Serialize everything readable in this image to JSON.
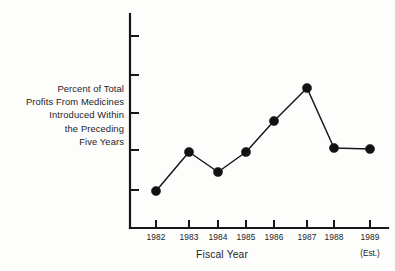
{
  "chart_data": {
    "type": "line",
    "title": "",
    "xlabel": "Fiscal Year",
    "ylabel": "Percent of Total Profits From Medicines Introduced Within the Preceding Five Years",
    "ylabel_lines": [
      "Percent of Total",
      "Profits From Medicines",
      "Introduced Within",
      "the Preceding",
      "Five Years"
    ],
    "categories": [
      "1982",
      "1983",
      "1984",
      "1985",
      "1986",
      "1987",
      "1988",
      "1989"
    ],
    "values": [
      19,
      39,
      29,
      39,
      54,
      71,
      41,
      40
    ],
    "series": [
      {
        "name": "Percent of Total Profits From Medicines Introduced Within the Preceding Five Years",
        "values": [
          19,
          39,
          29,
          39,
          54,
          71,
          41,
          40
        ]
      }
    ],
    "annotations": [
      {
        "text": "(Est.)",
        "attached_to": "1989"
      }
    ],
    "ylim": [
      0,
      100
    ],
    "y_tick_count": 5,
    "y_ticks_labeled": false,
    "y_tick_values": [
      20,
      40,
      60,
      80,
      100
    ],
    "grid": false,
    "legend": "none",
    "marker": "filled-circle",
    "line_color": "#18181b",
    "marker_color": "#121214",
    "axis_color": "#17171a",
    "background_color": "#fdfdfc"
  },
  "figure": {
    "x_axis_title": "Fiscal Year",
    "est_note": "(Est.)",
    "y_axis_title_line_1": "Percent of Total",
    "y_axis_title_line_2": "Profits From Medicines",
    "y_axis_title_line_3": "Introduced Within",
    "y_axis_title_line_4": "the Preceding",
    "y_axis_title_line_5": "Five Years",
    "x_tick_labels": [
      "1982",
      "1983",
      "1984",
      "1985",
      "1986",
      "1987",
      "1988",
      "1989"
    ]
  },
  "geometry": {
    "axis_x": 130,
    "axis_top": 14,
    "axis_bottom": 228,
    "axis_right": 388,
    "y_tick_y": [
      36,
      75,
      113,
      150,
      190
    ],
    "y_tick_length": 9,
    "x_tick_x": [
      156,
      189,
      218,
      246,
      274,
      307,
      334,
      370
    ],
    "x_tick_length": 8,
    "point_x": [
      156,
      189,
      218,
      246,
      274,
      307,
      334,
      370
    ],
    "point_y": [
      191,
      152,
      172,
      152,
      121,
      88,
      148,
      149
    ],
    "marker_radius": 4.6,
    "x_label_y": 232
  }
}
